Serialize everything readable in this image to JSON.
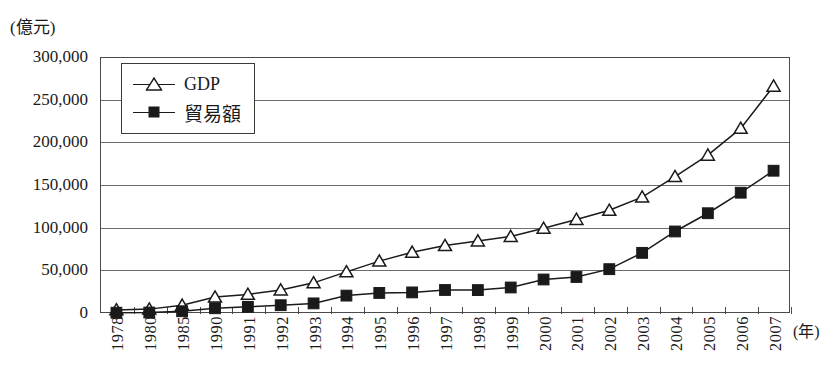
{
  "figure": {
    "y_unit_label": "(億元)",
    "x_unit_label": "(年)",
    "caption": ""
  },
  "legend": {
    "position": "top-left-inside",
    "entries": [
      {
        "label": "GDP",
        "marker": "hollow-triangle-up",
        "color": "#1a1a1a"
      },
      {
        "label": "貿易額",
        "marker": "filled-square",
        "color": "#1a1a1a"
      }
    ]
  },
  "chart_data": {
    "type": "line",
    "title": "",
    "subtitle": "",
    "xlabel": "(年)",
    "ylabel": "(億元)",
    "ylim": [
      0,
      300000
    ],
    "ytick_labels": [
      "0",
      "50,000",
      "100,000",
      "150,000",
      "200,000",
      "250,000",
      "300,000"
    ],
    "ytick_values": [
      0,
      50000,
      100000,
      150000,
      200000,
      250000,
      300000
    ],
    "grid": true,
    "grid_axis": "y",
    "legend_position": "upper left inside",
    "categories": [
      "1978",
      "1980",
      "1985",
      "1990",
      "1991",
      "1992",
      "1993",
      "1994",
      "1995",
      "1996",
      "1997",
      "1998",
      "1999",
      "2000",
      "2001",
      "2002",
      "2003",
      "2004",
      "2005",
      "2006",
      "2007"
    ],
    "series": [
      {
        "name": "GDP",
        "marker": "hollow-triangle-up",
        "color": "#1a1a1a",
        "values": [
          3645,
          4546,
          9016,
          18668,
          21781,
          26923,
          35334,
          48198,
          60794,
          71177,
          78973,
          84402,
          89677,
          99215,
          109655,
          120333,
          135823,
          159878,
          184937,
          216314,
          265810
        ]
      },
      {
        "name": "貿易額",
        "marker": "filled-square",
        "color": "#1a1a1a",
        "values": [
          355,
          570,
          2067,
          5560,
          7226,
          9120,
          11271,
          20382,
          23500,
          24134,
          26967,
          26850,
          29896,
          39273,
          42184,
          51378,
          70484,
          95539,
          116922,
          140974,
          166740
        ]
      }
    ]
  }
}
